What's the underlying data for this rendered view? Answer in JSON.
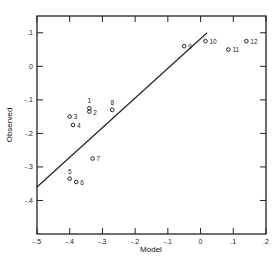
{
  "chart_data": {
    "type": "scatter",
    "title": "",
    "xlabel": "Model",
    "ylabel": "Observed",
    "xlim": [
      -0.5,
      0.2
    ],
    "ylim": [
      -0.5,
      0.15
    ],
    "grid": false,
    "legend": null,
    "x_ticks": [
      -0.5,
      -0.4,
      -0.3,
      -0.2,
      -0.1,
      0,
      0.1,
      0.2
    ],
    "x_tick_labels": [
      "-.5",
      "-.4",
      "-.3",
      "-.2",
      "-.1",
      "0",
      ".1",
      ".2"
    ],
    "y_ticks": [
      0.1,
      0,
      -0.1,
      -0.2,
      -0.3,
      -0.4
    ],
    "y_tick_labels": [
      ".1",
      "0",
      "-.1",
      "-.2",
      "-.3",
      "-.4"
    ],
    "points": [
      {
        "label": "1",
        "x": -0.34,
        "y": -0.125
      },
      {
        "label": "2",
        "x": -0.34,
        "y": -0.135
      },
      {
        "label": "3",
        "x": -0.4,
        "y": -0.15
      },
      {
        "label": "4",
        "x": -0.39,
        "y": -0.175
      },
      {
        "label": "5",
        "x": -0.4,
        "y": -0.335
      },
      {
        "label": "6",
        "x": -0.38,
        "y": -0.345
      },
      {
        "label": "7",
        "x": -0.33,
        "y": -0.275
      },
      {
        "label": "8",
        "x": -0.27,
        "y": -0.13
      },
      {
        "label": "9",
        "x": -0.05,
        "y": 0.06
      },
      {
        "label": "10",
        "x": 0.015,
        "y": 0.075
      },
      {
        "label": "11",
        "x": 0.085,
        "y": 0.05
      },
      {
        "label": "12",
        "x": 0.14,
        "y": 0.075
      }
    ],
    "fit_line": {
      "x": [
        -0.5,
        0.02
      ],
      "y": [
        -0.36,
        0.1
      ]
    }
  }
}
